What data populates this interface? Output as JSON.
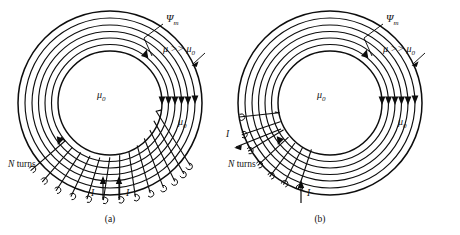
{
  "figure": {
    "kind": "toroid-magnetic-circuit-diagram",
    "background_color": "#ffffff",
    "ink_color": "#0d0d0d",
    "panels": [
      {
        "id": "a",
        "caption": "(a)",
        "center": {
          "x": 110,
          "y": 103
        },
        "labels": {
          "flux": "Ψ",
          "flux_sub": "m",
          "permeability_core": "μ >> μ",
          "permeability_core_sub": "0",
          "permeability_inner": "μ",
          "permeability_inner_sub": "0",
          "permeability_outer": "μ",
          "permeability_outer_sub": "0",
          "turns": "N turns",
          "current_left": "I",
          "current_right": "I"
        },
        "rings": 7,
        "inner_radius": 52,
        "outer_radius": 92,
        "winding_arc_start_deg": 150,
        "winding_arc_end_deg": 30,
        "winding_count": 13,
        "lead_count": 2
      },
      {
        "id": "b",
        "caption": "(b)",
        "center": {
          "x": 330,
          "y": 103
        },
        "labels": {
          "flux": "Ψ",
          "flux_sub": "m",
          "permeability_core": "μ >> μ",
          "permeability_core_sub": "0",
          "permeability_inner": "μ",
          "permeability_inner_sub": "0",
          "permeability_outer": "μ",
          "permeability_outer_sub": "0",
          "turns": "N turns",
          "current_in": "I",
          "current_out": "I"
        },
        "rings": 7,
        "inner_radius": 52,
        "outer_radius": 92,
        "winding_arc_start_deg": 168,
        "winding_arc_end_deg": 92,
        "winding_count": 7,
        "lead_count": 1
      }
    ]
  }
}
